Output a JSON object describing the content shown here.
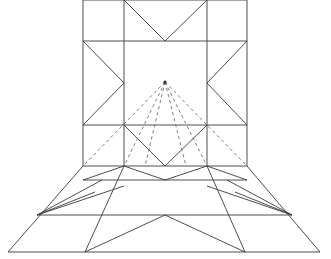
{
  "figure": {
    "background_color": "#ffffff",
    "line_color": "#3a3a3a",
    "dashed_line_color": "#6e6e6e",
    "line_width": 0.9,
    "canvas": {
      "width": 331,
      "height": 259
    }
  },
  "geometry": {
    "vanishing_point": {
      "x": 165,
      "y": 82
    },
    "elevation_panel": {
      "name": "upper-elevation-square",
      "left": 83,
      "right": 247,
      "top": 0,
      "bottom": 166,
      "grid_x": [
        83,
        124,
        207,
        247
      ],
      "grid_y": [
        0,
        41,
        125,
        166
      ]
    },
    "floor_panel": {
      "name": "lower-perspective-floor",
      "top_left": {
        "x": 83,
        "y": 166
      },
      "top_right": {
        "x": 247,
        "y": 166
      },
      "bottom_left": {
        "x": 8,
        "y": 252
      },
      "bottom_right": {
        "x": 320,
        "y": 252
      },
      "horizontals_y": [
        166,
        180,
        215,
        252
      ]
    },
    "solid_paths": [
      "M83,0 L247,0",
      "M83,0 L83,166",
      "M247,0 L247,166",
      "M83,41 L247,41",
      "M83,125 L247,125",
      "M83,166 L247,166",
      "M124,0 L124,166",
      "M207,0 L207,166",
      "M124,0 L165,41 L207,0",
      "M83,41 L124,83 L83,125",
      "M247,41 L207,83 L247,125",
      "M124,125 L165,166 L207,125",
      "M83,166 L8,252",
      "M247,166 L320,252",
      "M8,252 L320,252",
      "M83,180 L247,180",
      "M37,215 L292,215",
      "M124,166 L165,180 L207,166",
      "M83,180 L124,166",
      "M247,180 L207,166",
      "M37,215 L102,180",
      "M292,215 L227,180",
      "M37,215 L124,186",
      "M292,215 L207,186",
      "M124,166 L85,252",
      "M207,166 L245,252",
      "M85,252 L165,215 L245,252",
      "M37,215 L95,192",
      "M292,215 L235,192"
    ],
    "dashed_paths": [
      "M165,82 L124,166",
      "M165,82 L207,166",
      "M165,82 L83,166",
      "M165,82 L247,166",
      "M165,82 L145,166",
      "M165,82 L186,166"
    ]
  }
}
